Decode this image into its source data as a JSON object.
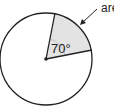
{
  "diagram": {
    "type": "circle-sector",
    "angle_label": "70°",
    "callout_label": "area",
    "colors": {
      "sector_fill": "#e3e3e3",
      "stroke": "#222222",
      "arc_mark": "#bfbfbf"
    }
  }
}
